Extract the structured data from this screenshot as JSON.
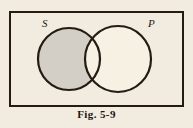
{
  "figure": {
    "caption": "Fig. 5-9",
    "background_color": "#f2ece0",
    "border_color": "#241c14",
    "stroke_color": "#241c14",
    "shaded_color": "#d4cfc6",
    "unshaded_color": "#f7f1e4",
    "frame": {
      "x": 9,
      "y": 11,
      "width": 175,
      "height": 96,
      "border_width": 2
    },
    "diagram_type": "venn",
    "shading_description": "S minus P shaded",
    "sets": [
      {
        "name": "S",
        "label": "S",
        "label_x": 42,
        "label_y": 27,
        "center_x": 69,
        "center_y": 59,
        "radius": 31,
        "shaded": true
      },
      {
        "name": "P",
        "label": "P",
        "label_x": 148,
        "label_y": 27,
        "center_x": 118,
        "center_y": 59,
        "radius": 33,
        "shaded": false
      }
    ]
  }
}
